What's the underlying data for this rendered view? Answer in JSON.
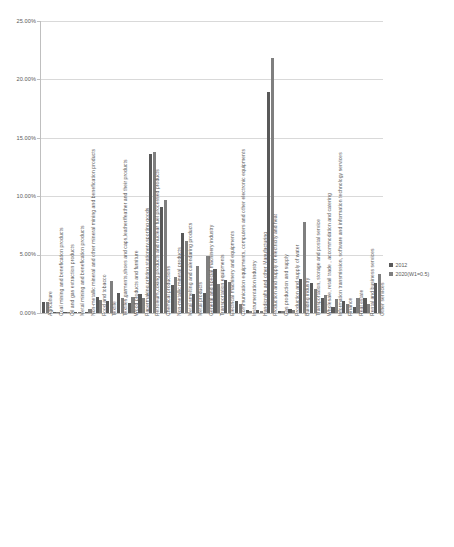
{
  "chart_data": {
    "type": "bar",
    "title": "",
    "subtitle": "",
    "xlabel": "",
    "ylabel": "",
    "ylim": [
      0,
      25
    ],
    "y_tick_labels": [
      "0.00%",
      "5.00%",
      "10.00%",
      "15.00%",
      "20.00%",
      "25.00%"
    ],
    "y_tick_values": [
      0,
      5,
      10,
      15,
      20,
      25
    ],
    "grid": true,
    "legend_position": "right",
    "value_unit": "%",
    "categories": [
      "Agriculture",
      "Coal mining and benefication products",
      "Oil and gas extraction products",
      "Metal mining and benefication products",
      "Non-metallic mineral and other mineral mining and benefication products",
      "Food and tobacco",
      "Textile",
      "Textiles,garments,shoes and caps,leather/feather and their products",
      "Wood products and furniture",
      "Papermaking,printing,stationery,sporting goods",
      "Petroleum,coking products and nuclear fuel processed products",
      "Chemical productions",
      "Non-metallic mineral products",
      "Metal smelting and calendaring products",
      "Metal products",
      "General and special machinery industry",
      "Transportation equipments",
      "Electrical machinery and equipments",
      "Communication equipments, computers and other electronic equipments",
      "Instrumentation industry",
      "Handicrafts and other Manufacturing",
      "Production and supply of electricity and heat",
      "Gas production and supply",
      "Production and supply of water",
      "Building industry",
      "Transportation, storage and postal service",
      "Wholesale, retail trade , accommodation and catering",
      "Information transmission, software and information technology services",
      "Finance",
      "Real estate",
      "Rental and business services",
      "Other services"
    ],
    "series": [
      {
        "name": "2012",
        "color": "#595959",
        "values": [
          0.95,
          0.05,
          0.05,
          0.05,
          0.08,
          1.35,
          1.05,
          1.75,
          0.85,
          1.6,
          13.65,
          9.05,
          2.4,
          6.85,
          1.6,
          1.75,
          3.75,
          2.85,
          1.0,
          0.25,
          0.22,
          18.95,
          0.2,
          0.35,
          2.9,
          2.55,
          1.3,
          0.55,
          1.05,
          0.55,
          1.25,
          2.55
        ]
      },
      {
        "name": "2020(W1=0.5)",
        "color": "#7f7f7f",
        "values": [
          0.9,
          0.05,
          0.05,
          0.05,
          0.3,
          1.1,
          2.75,
          1.3,
          1.35,
          1.25,
          13.8,
          9.7,
          3.05,
          6.2,
          4.05,
          4.85,
          2.5,
          2.65,
          0.75,
          0.2,
          0.18,
          21.8,
          0.18,
          0.28,
          7.75,
          2.05,
          1.55,
          1.2,
          0.8,
          1.3,
          0.75,
          3.35
        ]
      }
    ],
    "legend": [
      {
        "label": "2012",
        "color": "#595959"
      },
      {
        "label": "2020(W1=0.5)",
        "color": "#7f7f7f"
      }
    ]
  }
}
